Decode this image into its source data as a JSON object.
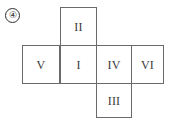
{
  "figure": {
    "label": "④",
    "label_name": "circled-number-four",
    "kind": "cube-net-diagram",
    "stroke_color": "#6a6a6a",
    "text_color": "#3a3a3a",
    "background_color": "#ffffff"
  },
  "net": {
    "cells": [
      {
        "id": "top",
        "label": "II",
        "row": 0,
        "col": 1
      },
      {
        "id": "left2",
        "label": "V",
        "row": 1,
        "col": 0
      },
      {
        "id": "left1",
        "label": "I",
        "row": 1,
        "col": 1
      },
      {
        "id": "center",
        "label": "IV",
        "row": 1,
        "col": 2
      },
      {
        "id": "right",
        "label": "VI",
        "row": 1,
        "col": 3
      },
      {
        "id": "bottom",
        "label": "III",
        "row": 2,
        "col": 2
      }
    ]
  }
}
